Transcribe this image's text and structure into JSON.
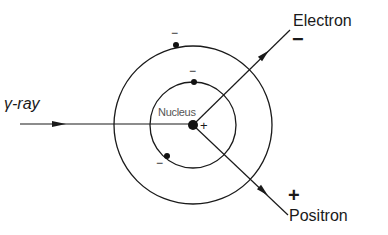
{
  "diagram": {
    "labels": {
      "gamma_ray": "γ-ray",
      "nucleus": "Nucleus",
      "nucleus_charge": "+",
      "electron": "Electron",
      "electron_charge": "−",
      "positron": "Positron",
      "positron_charge": "+",
      "orbital_charge": "−"
    },
    "geometry": {
      "nucleus_center": [
        193,
        125
      ],
      "outer_orbit_radius": 79,
      "inner_orbit_radius": 43,
      "orbital_electrons": [
        [
          176,
          45
        ],
        [
          194,
          82
        ],
        [
          167,
          156
        ]
      ]
    },
    "colors": {
      "stroke": "#1a1a1a",
      "background": "#ffffff"
    }
  }
}
